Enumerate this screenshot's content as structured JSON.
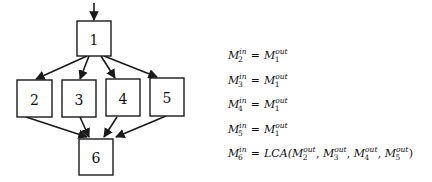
{
  "diagram": {
    "type": "control-flow-graph",
    "nodes": [
      {
        "id": "1",
        "label": "1"
      },
      {
        "id": "2",
        "label": "2"
      },
      {
        "id": "3",
        "label": "3"
      },
      {
        "id": "4",
        "label": "4"
      },
      {
        "id": "5",
        "label": "5"
      },
      {
        "id": "6",
        "label": "6"
      }
    ],
    "entry_edge": {
      "to": "1"
    },
    "edges": [
      {
        "from": "1",
        "to": "2"
      },
      {
        "from": "1",
        "to": "3"
      },
      {
        "from": "1",
        "to": "4"
      },
      {
        "from": "1",
        "to": "5"
      },
      {
        "from": "2",
        "to": "6"
      },
      {
        "from": "3",
        "to": "6"
      },
      {
        "from": "4",
        "to": "6"
      },
      {
        "from": "5",
        "to": "6"
      }
    ]
  },
  "equations": [
    {
      "lhs": {
        "sym": "M",
        "sub": "2",
        "sup": "in"
      },
      "op": "=",
      "rhs": [
        {
          "sym": "M",
          "sub": "1",
          "sup": "out"
        }
      ]
    },
    {
      "lhs": {
        "sym": "M",
        "sub": "3",
        "sup": "in"
      },
      "op": "=",
      "rhs": [
        {
          "sym": "M",
          "sub": "1",
          "sup": "out"
        }
      ]
    },
    {
      "lhs": {
        "sym": "M",
        "sub": "4",
        "sup": "in"
      },
      "op": "=",
      "rhs": [
        {
          "sym": "M",
          "sub": "1",
          "sup": "out"
        }
      ]
    },
    {
      "lhs": {
        "sym": "M",
        "sub": "5",
        "sup": "in"
      },
      "op": "=",
      "rhs": [
        {
          "sym": "M",
          "sub": "1",
          "sup": "out"
        }
      ]
    },
    {
      "lhs": {
        "sym": "M",
        "sub": "6",
        "sup": "in"
      },
      "op": "=",
      "fn": "LCA",
      "rhs": [
        {
          "sym": "M",
          "sub": "2",
          "sup": "out"
        },
        {
          "sym": "M",
          "sub": "3",
          "sup": "out"
        },
        {
          "sym": "M",
          "sub": "4",
          "sup": "out"
        },
        {
          "sym": "M",
          "sub": "5",
          "sup": "out"
        }
      ]
    }
  ]
}
